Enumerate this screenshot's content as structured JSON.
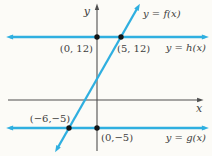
{
  "colors": {
    "background": "#fcfbf7",
    "axis": "#4f4f4f",
    "line": "#2fafe0",
    "point": "#151515",
    "text": "#3e3e3e"
  },
  "chart_data": {
    "type": "line",
    "title": "",
    "xlabel": "x",
    "ylabel": "y",
    "grid": false,
    "legend_position": "inline-labels",
    "series": [
      {
        "name": "y = f(x)",
        "description": "slanted line through (-6,-5) and (5,12)",
        "points": [
          [
            -6,
            -5
          ],
          [
            5,
            12
          ]
        ]
      },
      {
        "name": "y = h(x)",
        "description": "horizontal line y = 12",
        "points": [
          [
            0,
            12
          ],
          [
            5,
            12
          ]
        ]
      },
      {
        "name": "y = g(x)",
        "description": "horizontal line y = -5",
        "points": [
          [
            -6,
            -5
          ],
          [
            0,
            -5
          ]
        ]
      }
    ],
    "marked_points": [
      {
        "label": "(0, 12)",
        "x": 0,
        "y": 12
      },
      {
        "label": "(5, 12)",
        "x": 5,
        "y": 12
      },
      {
        "label": "(−6,−5)",
        "x": -6,
        "y": -5
      },
      {
        "label": "(0,−5)",
        "x": 0,
        "y": -5
      }
    ]
  },
  "geometry": {
    "viewbox": [
      0,
      0,
      212,
      156
    ],
    "axes": [
      {
        "name": "x-axis",
        "x1": 8,
        "y1": 100,
        "x2": 200,
        "y2": 100,
        "arrow_start": false,
        "arrow_end": true
      },
      {
        "name": "y-axis",
        "x1": 97,
        "y1": 151,
        "x2": 97,
        "y2": 7,
        "arrow_start": false,
        "arrow_end": true
      }
    ],
    "lines": [
      {
        "name": "line-h",
        "x1": 10,
        "y1": 37,
        "x2": 205,
        "y2": 37,
        "arrow_start": true,
        "arrow_end": true
      },
      {
        "name": "line-g",
        "x1": 10,
        "y1": 128,
        "x2": 205,
        "y2": 128,
        "arrow_start": true,
        "arrow_end": true
      },
      {
        "name": "line-f",
        "x1": 57,
        "y1": 149,
        "x2": 138,
        "y2": 7,
        "arrow_start": true,
        "arrow_end": true
      }
    ],
    "points": [
      {
        "name": "point-0-12",
        "x": 97,
        "y": 37,
        "r": 2.7
      },
      {
        "name": "point-5-12",
        "x": 121,
        "y": 37,
        "r": 2.7
      },
      {
        "name": "point-n6-n5",
        "x": 69,
        "y": 128,
        "r": 2.7
      },
      {
        "name": "point-0-n5",
        "x": 97,
        "y": 128,
        "r": 2.7
      }
    ],
    "labels": [
      {
        "name": "y-axis-label",
        "text": "y",
        "x": 90,
        "y": 15,
        "anchor": "end",
        "italic": true,
        "size": 11
      },
      {
        "name": "x-axis-label",
        "text": "x",
        "x": 199,
        "y": 112,
        "anchor": "middle",
        "italic": true,
        "size": 11
      },
      {
        "name": "label-f",
        "text": "y = f(x)",
        "x": 143,
        "y": 17,
        "anchor": "start",
        "italic": true,
        "size": 10
      },
      {
        "name": "label-h",
        "text": "y = h(x)",
        "x": 206,
        "y": 51,
        "anchor": "end",
        "italic": true,
        "size": 10
      },
      {
        "name": "label-g",
        "text": "y = g(x)",
        "x": 206,
        "y": 141,
        "anchor": "end",
        "italic": true,
        "size": 10
      },
      {
        "name": "point-label-0-12",
        "text": "(0, 12)",
        "x": 93,
        "y": 52,
        "anchor": "end",
        "italic": false,
        "size": 10
      },
      {
        "name": "point-label-5-12",
        "text": "(5, 12)",
        "x": 117,
        "y": 52,
        "anchor": "start",
        "italic": false,
        "size": 10
      },
      {
        "name": "point-label-n6-n5",
        "text": "(−6,−5)",
        "x": 50,
        "y": 122,
        "anchor": "middle",
        "italic": false,
        "size": 10
      },
      {
        "name": "point-label-0-n5",
        "text": "(0,−5)",
        "x": 101,
        "y": 141,
        "anchor": "start",
        "italic": false,
        "size": 10
      }
    ]
  }
}
